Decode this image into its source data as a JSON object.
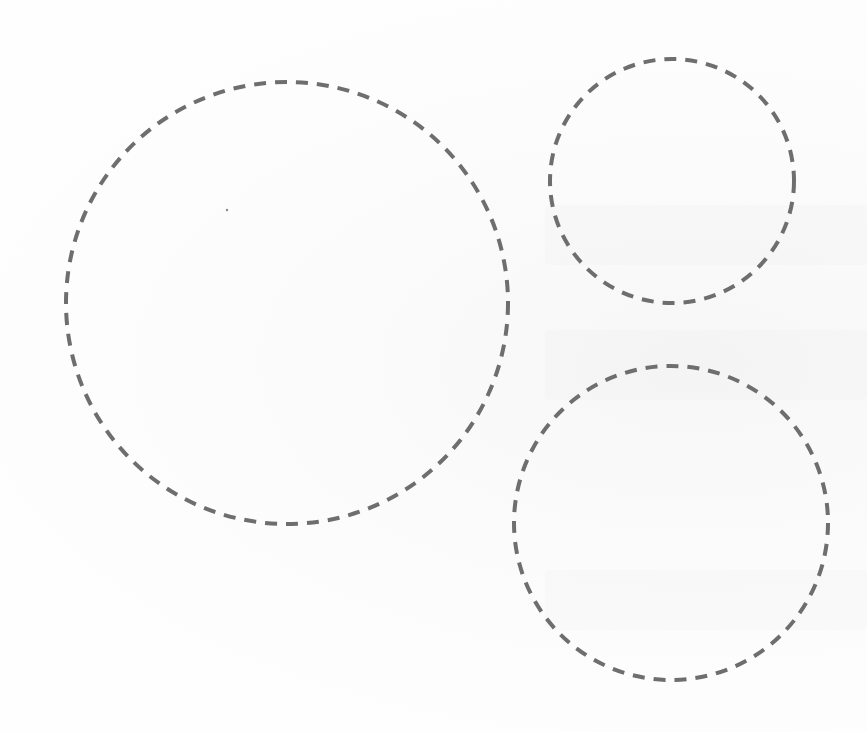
{
  "canvas": {
    "width": 867,
    "height": 732,
    "background": "#fdfdfd"
  },
  "style": {
    "stroke_color": "#6e6e6e",
    "stroke_width": 4,
    "dash": "12 9"
  },
  "shapes": [
    {
      "id": "large-circle",
      "type": "circle",
      "style": "dashed",
      "cx": 287,
      "cy": 303,
      "r": 221
    },
    {
      "id": "small-top-right-circle",
      "type": "circle",
      "style": "dashed",
      "cx": 672,
      "cy": 181,
      "r": 122
    },
    {
      "id": "medium-bottom-right-circle",
      "type": "circle",
      "style": "dashed",
      "cx": 671,
      "cy": 523,
      "r": 157
    }
  ],
  "specks": [
    {
      "x": 227,
      "y": 210,
      "r": 1.2
    }
  ]
}
